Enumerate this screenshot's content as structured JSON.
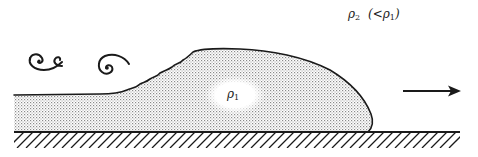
{
  "figure": {
    "type": "gravity-current-schematic",
    "labels": {
      "ambient_density": "ρ",
      "ambient_density_sub": "2",
      "ambient_note_prefix": "(<ρ",
      "ambient_note_sub": "1",
      "ambient_note_suffix": ")",
      "current_density": "ρ",
      "current_density_sub": "1"
    },
    "elements": [
      "eddy-1",
      "eddy-2",
      "dense-fluid-current",
      "direction-arrow",
      "ground-hatching"
    ],
    "colors": {
      "ink": "#1a1a1a",
      "stipple": "#9a9a9a",
      "background": "#ffffff"
    }
  }
}
